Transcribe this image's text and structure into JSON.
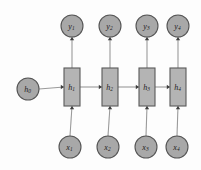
{
  "diagram": {
    "type": "rnn-unrolled-computational-graph",
    "background_color": "#fdfdfd",
    "node_fill_color": "#a8a8a8",
    "box_fill_color": "#b4b4b4",
    "node_stroke_color": "#555555",
    "edge_color": "#9a9a9a",
    "arrowhead_color": "#3d3d3d",
    "label_color": "#1c1c1c"
  },
  "initial_state": {
    "id": "h0",
    "base": "h",
    "subscript": "0",
    "shape": "circle",
    "cx": 28,
    "cy": 89,
    "r": 11
  },
  "hidden_states": [
    {
      "id": "h1",
      "base": "h",
      "subscript": "1",
      "shape": "rect",
      "x": 64,
      "y": 68,
      "w": 16,
      "h": 38
    },
    {
      "id": "h2",
      "base": "h",
      "subscript": "2",
      "shape": "rect",
      "x": 102,
      "y": 68,
      "w": 16,
      "h": 38
    },
    {
      "id": "h3",
      "base": "h",
      "subscript": "3",
      "shape": "rect",
      "x": 139,
      "y": 68,
      "w": 16,
      "h": 38
    },
    {
      "id": "h4",
      "base": "h",
      "subscript": "4",
      "shape": "rect",
      "x": 170,
      "y": 68,
      "w": 16,
      "h": 38
    }
  ],
  "outputs": [
    {
      "id": "y1",
      "base": "y",
      "subscript": "1",
      "shape": "circle",
      "cx": 72,
      "cy": 26,
      "r": 11
    },
    {
      "id": "y2",
      "base": "y",
      "subscript": "2",
      "shape": "circle",
      "cx": 110,
      "cy": 26,
      "r": 11
    },
    {
      "id": "y3",
      "base": "y",
      "subscript": "3",
      "shape": "circle",
      "cx": 147,
      "cy": 26,
      "r": 11
    },
    {
      "id": "y4",
      "base": "y",
      "subscript": "4",
      "shape": "circle",
      "cx": 178,
      "cy": 26,
      "r": 11
    }
  ],
  "inputs": [
    {
      "id": "x1",
      "base": "x",
      "subscript": "1",
      "shape": "circle",
      "cx": 70,
      "cy": 147,
      "r": 11
    },
    {
      "id": "x2",
      "base": "x",
      "subscript": "2",
      "shape": "circle",
      "cx": 108,
      "cy": 147,
      "r": 11
    },
    {
      "id": "x3",
      "base": "x",
      "subscript": "3",
      "shape": "circle",
      "cx": 146,
      "cy": 147,
      "r": 11
    },
    {
      "id": "x4",
      "base": "x",
      "subscript": "4",
      "shape": "circle",
      "cx": 177,
      "cy": 147,
      "r": 11
    }
  ],
  "edges": [
    {
      "id": "edge-h0-h1",
      "from": "h0",
      "to": "h1",
      "direction": "right"
    },
    {
      "id": "edge-h1-h2",
      "from": "h1",
      "to": "h2",
      "direction": "right"
    },
    {
      "id": "edge-h2-h3",
      "from": "h2",
      "to": "h3",
      "direction": "right"
    },
    {
      "id": "edge-h3-h4",
      "from": "h3",
      "to": "h4",
      "direction": "right"
    },
    {
      "id": "edge-x1-h1",
      "from": "x1",
      "to": "h1",
      "direction": "up"
    },
    {
      "id": "edge-x2-h2",
      "from": "x2",
      "to": "h2",
      "direction": "up"
    },
    {
      "id": "edge-x3-h3",
      "from": "x3",
      "to": "h3",
      "direction": "up"
    },
    {
      "id": "edge-x4-h4",
      "from": "x4",
      "to": "h4",
      "direction": "up"
    },
    {
      "id": "edge-h1-y1",
      "from": "h1",
      "to": "y1",
      "direction": "up"
    },
    {
      "id": "edge-h2-y2",
      "from": "h2",
      "to": "y2",
      "direction": "up"
    },
    {
      "id": "edge-h3-y3",
      "from": "h3",
      "to": "y3",
      "direction": "up"
    },
    {
      "id": "edge-h4-y4",
      "from": "h4",
      "to": "y4",
      "direction": "up"
    }
  ]
}
